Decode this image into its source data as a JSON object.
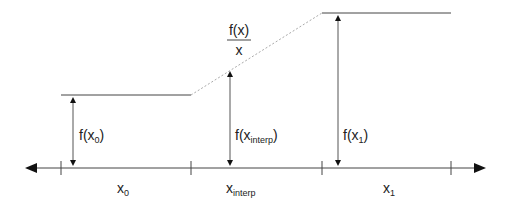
{
  "diagram": {
    "colors": {
      "line": "#333333",
      "dashed": "#aaaaaa",
      "text": "#222222"
    },
    "axis": {
      "ticks": [
        {
          "id": "t0",
          "x": 61
        },
        {
          "id": "t1",
          "x": 191
        },
        {
          "id": "t2",
          "x": 322
        },
        {
          "id": "t3",
          "x": 451
        }
      ],
      "labels": [
        {
          "id": "x0",
          "main": "x",
          "sub": "0"
        },
        {
          "id": "xinterp",
          "main": "x",
          "sub": "interp"
        },
        {
          "id": "x1",
          "main": "x",
          "sub": "1"
        }
      ]
    },
    "values": {
      "f_x0": {
        "prefix": "f(x",
        "sub": "0",
        "suffix": ")"
      },
      "f_xinterp": {
        "prefix": "f(x",
        "sub": "interp",
        "suffix": ")"
      },
      "f_x1": {
        "prefix": "f(x",
        "sub": "1",
        "suffix": ")"
      }
    },
    "slope_label": {
      "numerator": "f(x)",
      "denominator": "x"
    }
  }
}
